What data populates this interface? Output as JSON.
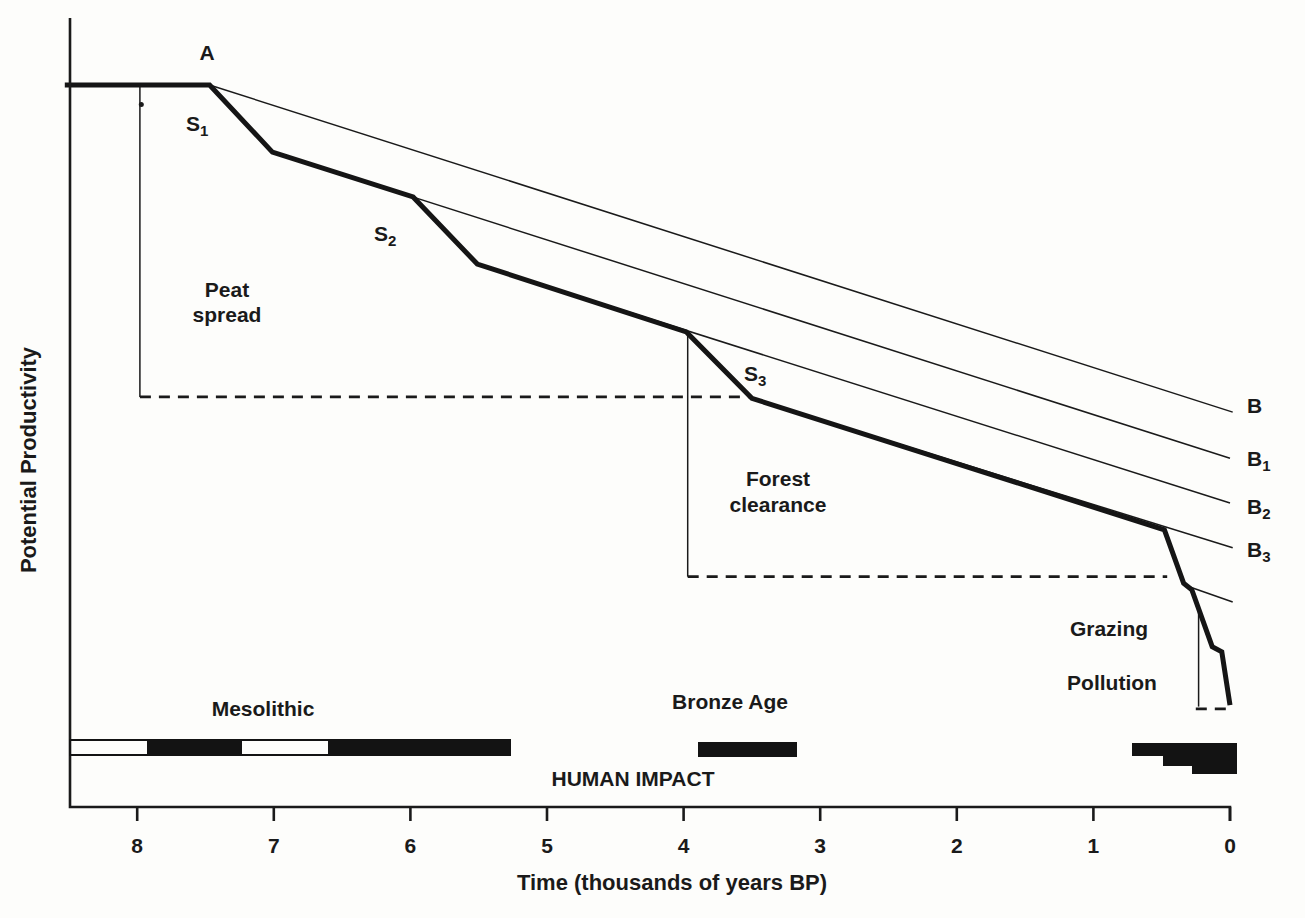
{
  "figure": {
    "background": "#fdfdfb",
    "ink": "#1a1a1a"
  },
  "chart_data": {
    "type": "line",
    "title": "",
    "xlabel": "Time (thousands of years BP)",
    "ylabel": "Potential Productivity",
    "x_axis": {
      "label": "Time (thousands of years BP)",
      "range": [
        8.5,
        0
      ],
      "reversed": true,
      "ticks": [
        8,
        7,
        6,
        5,
        4,
        3,
        2,
        1,
        0
      ]
    },
    "y_axis": {
      "label": "Potential Productivity",
      "range": [
        0,
        105
      ],
      "ticks": [],
      "unit": "relative (no scale shown)"
    },
    "grid": false,
    "legend": "inline labels A, S1, S2, S3, B, B1, B2, B3",
    "series": [
      {
        "name": "actual-potential-productivity",
        "style": "thick",
        "points": [
          [
            8.53,
            100
          ],
          [
            7.47,
            100
          ],
          [
            7.01,
            90.7
          ],
          [
            5.98,
            84.5
          ],
          [
            5.51,
            75.2
          ],
          [
            3.98,
            65.8
          ],
          [
            3.5,
            56.6
          ],
          [
            0.48,
            38.4
          ],
          [
            0.34,
            31.0
          ],
          [
            0.28,
            30.1
          ],
          [
            0.13,
            22.2
          ],
          [
            0.06,
            21.5
          ],
          [
            0.0,
            14.1
          ]
        ]
      },
      {
        "name": "line-B",
        "style": "thin",
        "points": [
          [
            7.47,
            100.0
          ],
          [
            -0.02,
            54.7
          ]
        ]
      },
      {
        "name": "line-B1",
        "style": "thin",
        "points": [
          [
            7.01,
            90.7
          ],
          [
            0.0,
            48.3
          ]
        ]
      },
      {
        "name": "line-B2",
        "style": "thin",
        "points": [
          [
            5.51,
            75.2
          ],
          [
            0.0,
            42.1
          ]
        ]
      },
      {
        "name": "line-B3",
        "style": "thin",
        "points": [
          [
            3.5,
            56.6
          ],
          [
            -0.02,
            35.9
          ]
        ]
      },
      {
        "name": "line-after-grazing-unlabeled",
        "style": "thin",
        "points": [
          [
            0.33,
            30.7
          ],
          [
            -0.02,
            28.4
          ]
        ]
      }
    ],
    "reference_lines": [
      {
        "name": "peat-spread-level-dashed",
        "style": "dashed",
        "points": [
          [
            7.98,
            56.8
          ],
          [
            3.5,
            56.8
          ]
        ]
      },
      {
        "name": "forest-clearance-level-dashed",
        "style": "dashed",
        "points": [
          [
            3.97,
            31.9
          ],
          [
            0.46,
            31.9
          ]
        ]
      },
      {
        "name": "present-level-dashed",
        "style": "dashed",
        "points": [
          [
            0.25,
            13.6
          ],
          [
            -0.02,
            13.6
          ]
        ]
      },
      {
        "name": "peat-spread-left-bound",
        "style": "thin",
        "points": [
          [
            7.98,
            100.0
          ],
          [
            7.98,
            56.8
          ]
        ]
      },
      {
        "name": "forest-clearance-left-bound",
        "style": "thin",
        "points": [
          [
            3.97,
            65.8
          ],
          [
            3.97,
            31.9
          ]
        ]
      },
      {
        "name": "pollution-left-bound",
        "style": "thin",
        "points": [
          [
            0.23,
            27.7
          ],
          [
            0.23,
            13.9
          ]
        ]
      }
    ],
    "events": [
      {
        "label": "A",
        "time_bp_k": 7.47,
        "note": "start of decline"
      },
      {
        "label": "S1",
        "time_bp_k": 7.47,
        "note": "first steep step"
      },
      {
        "label": "S2",
        "time_bp_k": 5.98,
        "note": "second steep step"
      },
      {
        "label": "S3",
        "time_bp_k": 3.98,
        "note": "third steep step"
      },
      {
        "label": "Peat spread",
        "interval_bp_k": [
          8.0,
          3.5
        ]
      },
      {
        "label": "Forest clearance",
        "interval_bp_k": [
          4.0,
          0.46
        ]
      },
      {
        "label": "Grazing",
        "time_bp_k": 0.48
      },
      {
        "label": "Pollution",
        "time_bp_k": 0.23
      }
    ],
    "impact_timeline": {
      "caption": "HUMAN IMPACT",
      "periods": [
        {
          "name": "Mesolithic outline bar",
          "interval_bp_k": [
            8.49,
            5.27
          ],
          "fill": "outline"
        },
        {
          "name": "Mesolithic impact 1",
          "interval_bp_k": [
            7.93,
            7.23
          ],
          "fill": "black"
        },
        {
          "name": "Mesolithic impact 2",
          "interval_bp_k": [
            6.6,
            5.27
          ],
          "fill": "black"
        },
        {
          "name": "Bronze Age impact",
          "interval_bp_k": [
            3.89,
            3.17
          ],
          "fill": "black"
        },
        {
          "name": "Recent impact step 1",
          "interval_bp_k": [
            0.72,
            0.0
          ],
          "fill": "black"
        },
        {
          "name": "Recent impact step 2",
          "interval_bp_k": [
            0.49,
            0.0
          ],
          "fill": "black"
        },
        {
          "name": "Recent impact step 3",
          "interval_bp_k": [
            0.28,
            0.0
          ],
          "fill": "black"
        }
      ]
    }
  },
  "markers": [
    {
      "name": "peat-start-dot",
      "t": 7.97,
      "p": 97.3,
      "r": 2.5
    }
  ],
  "bars_px": [
    {
      "name": "mesolithic-bar-fill-1",
      "x": 147,
      "y": 740,
      "w": 95,
      "h": 15,
      "type": "fill"
    },
    {
      "name": "mesolithic-bar-fill-2",
      "x": 328,
      "y": 740,
      "w": 182,
      "h": 15,
      "type": "fill"
    },
    {
      "name": "mesolithic-bar-outline",
      "x": 70,
      "y": 740,
      "w": 440,
      "h": 15,
      "type": "outline"
    },
    {
      "name": "bronze-age-bar",
      "x": 698,
      "y": 742,
      "w": 99,
      "h": 15,
      "type": "fill"
    },
    {
      "name": "recent-impact-step-1",
      "x": 1132,
      "y": 743,
      "w": 105,
      "h": 13,
      "type": "fill"
    },
    {
      "name": "recent-impact-step-2",
      "x": 1163,
      "y": 743,
      "w": 74,
      "h": 23,
      "type": "fill"
    },
    {
      "name": "recent-impact-step-3",
      "x": 1192,
      "y": 743,
      "w": 45,
      "h": 31,
      "type": "fill"
    }
  ],
  "labels": [
    {
      "name": "point-a-label",
      "text": "A",
      "x": 207,
      "y": 60,
      "anchor": "middle"
    },
    {
      "name": "s1-label",
      "text": "S",
      "sub": "1",
      "x": 186,
      "y": 131,
      "anchor": "start"
    },
    {
      "name": "s2-label",
      "text": "S",
      "sub": "2",
      "x": 374,
      "y": 241,
      "anchor": "start"
    },
    {
      "name": "s3-label",
      "text": "S",
      "sub": "3",
      "x": 744,
      "y": 381,
      "anchor": "start"
    },
    {
      "name": "b-label",
      "text": "B",
      "x": 1247,
      "y": 413,
      "anchor": "start"
    },
    {
      "name": "b1-label",
      "text": "B",
      "sub": "1",
      "x": 1247,
      "y": 466,
      "anchor": "start"
    },
    {
      "name": "b2-label",
      "text": "B",
      "sub": "2",
      "x": 1247,
      "y": 514,
      "anchor": "start"
    },
    {
      "name": "b3-label",
      "text": "B",
      "sub": "3",
      "x": 1247,
      "y": 557,
      "anchor": "start"
    },
    {
      "name": "peat-spread-label",
      "lines": [
        "Peat",
        "spread"
      ],
      "x": 227,
      "y": 297,
      "anchor": "middle",
      "line_height": 25
    },
    {
      "name": "forest-clearance-label",
      "lines": [
        "Forest",
        "clearance"
      ],
      "x": 778,
      "y": 486,
      "anchor": "middle",
      "line_height": 26
    },
    {
      "name": "grazing-label",
      "text": "Grazing",
      "x": 1109,
      "y": 636,
      "anchor": "middle"
    },
    {
      "name": "pollution-label",
      "text": "Pollution",
      "x": 1112,
      "y": 690,
      "anchor": "middle"
    },
    {
      "name": "mesolithic-label",
      "text": "Mesolithic",
      "x": 263,
      "y": 716,
      "anchor": "middle"
    },
    {
      "name": "bronze-age-label",
      "text": "Bronze Age",
      "x": 730,
      "y": 709,
      "anchor": "middle"
    },
    {
      "name": "human-impact-label",
      "text": "HUMAN IMPACT",
      "x": 633,
      "y": 786,
      "anchor": "middle"
    }
  ]
}
